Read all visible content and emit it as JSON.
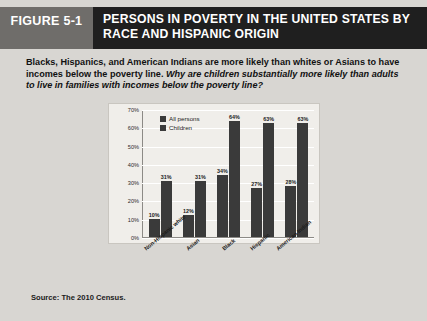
{
  "header": {
    "figure_tag": "FIGURE 5-1",
    "title": "PERSONS IN POVERTY IN THE UNITED STATES BY RACE AND HISPANIC ORIGIN"
  },
  "caption": {
    "statement": "Blacks, Hispanics, and American Indians are more likely than whites or Asians to have incomes below the poverty line. ",
    "question": "Why are children substantially more likely than adults to live in families with incomes below the poverty line?"
  },
  "source": "Source: The 2010 Census.",
  "colors": {
    "tag_bg": "#6f6d6a",
    "header_bg": "#1f1f1f",
    "page_bg": "#d8d6d2",
    "chart_bg": "#f0eeea",
    "bar": "#3a3a3a",
    "gridline": "#ffffff"
  },
  "chart_data": {
    "type": "bar",
    "title": "",
    "xlabel": "",
    "ylabel": "",
    "ylim": [
      0,
      70
    ],
    "ytick_labels": [
      "70%",
      "60%",
      "50%",
      "40%",
      "30%",
      "20%",
      "10%",
      "0%"
    ],
    "ytick_values": [
      70,
      60,
      50,
      40,
      30,
      20,
      10,
      0
    ],
    "grid": true,
    "legend_position": "top-left",
    "categories": [
      "Non-Hispanic white",
      "Asian",
      "Black",
      "Hispanic",
      "American Indian"
    ],
    "series": [
      {
        "name": "All persons",
        "values": [
          10,
          12,
          34,
          27,
          28
        ],
        "labels": [
          "10%",
          "12%",
          "34%",
          "27%",
          "28%"
        ]
      },
      {
        "name": "Children",
        "values": [
          31,
          31,
          64,
          63,
          63
        ],
        "labels": [
          "31%",
          "31%",
          "64%",
          "63%",
          "63%"
        ]
      }
    ]
  }
}
